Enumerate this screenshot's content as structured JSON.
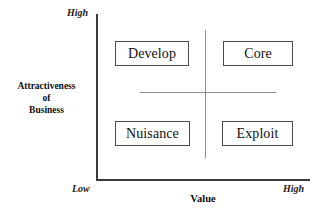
{
  "chart_data": {
    "type": "scatter",
    "title": "",
    "xlabel": "Value",
    "ylabel": "Attractiveness of Business",
    "grid": false,
    "legend": null,
    "x_axis": {
      "label": "Value",
      "min_tick_label": "Low",
      "max_tick_label": "High",
      "range": [
        "Low",
        "High"
      ]
    },
    "y_axis": {
      "label_lines": [
        "Attractiveness",
        "of",
        "Business"
      ],
      "label": "Attractiveness of Business",
      "min_tick_label": "Low",
      "max_tick_label": "High",
      "range": [
        "Low",
        "High"
      ]
    },
    "quadrants": [
      {
        "id": "top-left",
        "label": "Develop",
        "x": "Low",
        "y": "High"
      },
      {
        "id": "top-right",
        "label": "Core",
        "x": "High",
        "y": "High"
      },
      {
        "id": "bottom-left",
        "label": "Nuisance",
        "x": "Low",
        "y": "Low"
      },
      {
        "id": "bottom-right",
        "label": "Exploit",
        "x": "High",
        "y": "Low"
      }
    ],
    "colors": {
      "axis": "#3a3a3a",
      "divider": "#8d8d8d",
      "box_border": "#4a4a4a",
      "text": "#111111",
      "background": "#ffffff"
    }
  },
  "matrix": {
    "axes": {
      "y_title_line1": "Attractiveness",
      "y_title_line2": "of",
      "y_title_line3": "Business",
      "x_title": "Value",
      "y_high": "High",
      "y_low": "Low",
      "x_high": "High"
    },
    "quadrants": {
      "top_left": "Develop",
      "top_right": "Core",
      "bottom_left": "Nuisance",
      "bottom_right": "Exploit"
    }
  }
}
